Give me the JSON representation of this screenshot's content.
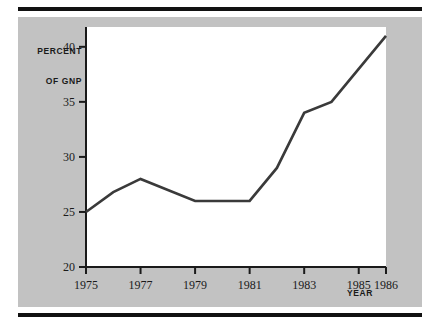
{
  "figure": {
    "background_color": "#ffffff",
    "panel_color": "#c2c2c2",
    "plot_color": "#ffffff",
    "rule_color": "#111111",
    "line_color": "#3a3a3a"
  },
  "labels": {
    "y_axis_title_line1": "PERCENT",
    "y_axis_title_line2": "OF GNP",
    "x_axis_title": "YEAR"
  },
  "chart_data": {
    "type": "line",
    "title": "",
    "xlabel": "YEAR",
    "ylabel": "PERCENT OF GNP",
    "xlim": [
      1975,
      1986
    ],
    "ylim": [
      20,
      41.8
    ],
    "grid": false,
    "legend": false,
    "x_ticks": [
      1975,
      1977,
      1979,
      1981,
      1983,
      1985,
      1986
    ],
    "x_tick_labels": [
      "1975",
      "1977",
      "1979",
      "1981",
      "1983",
      "1985",
      "1986"
    ],
    "y_ticks": [
      20,
      25,
      30,
      35,
      40
    ],
    "y_tick_labels": [
      "20",
      "25",
      "30",
      "35",
      "40"
    ],
    "series": [
      {
        "name": "Percent of GNP",
        "x": [
          1975,
          1976,
          1977,
          1979,
          1981,
          1982,
          1983,
          1984,
          1986
        ],
        "values": [
          25.0,
          26.8,
          28.0,
          26.0,
          26.0,
          29.0,
          34.0,
          35.0,
          41.0
        ]
      }
    ]
  }
}
